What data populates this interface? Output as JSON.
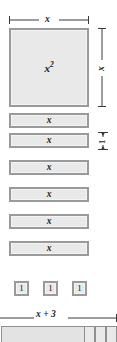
{
  "figure": {
    "colors": {
      "tile_fill": "#e9e9e9",
      "tile_border": "#9a9a9a",
      "rule_stroke": "#3a3a3a",
      "text": "#1a1a1a",
      "background": "#ffffff"
    },
    "top_dimension": {
      "label": "x"
    },
    "right_dimension": {
      "label": "x"
    },
    "unit_height_dimension": {
      "label": "1"
    },
    "square_tile": {
      "base": "x",
      "exponent": "2"
    },
    "x_bars": [
      {
        "label": "x"
      },
      {
        "label": "x"
      },
      {
        "label": "x"
      },
      {
        "label": "x"
      },
      {
        "label": "x"
      },
      {
        "label": "x"
      }
    ],
    "unit_tiles": [
      {
        "label": "1"
      },
      {
        "label": "1"
      },
      {
        "label": "1"
      }
    ],
    "bottom_dimension": {
      "label": "x + 3"
    }
  }
}
